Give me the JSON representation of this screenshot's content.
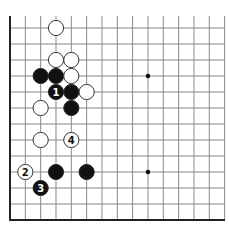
{
  "diagram": {
    "type": "go-board",
    "grid": {
      "cols": 15,
      "rows": 13,
      "x0": 10,
      "y0": 28,
      "dx": 15.33,
      "dy": 16,
      "top_cut": 16,
      "right_end": 225
    },
    "colors": {
      "line": "#888888",
      "edge": "#222222",
      "black": "#111111",
      "white": "#ffffff",
      "star": "#111111"
    },
    "star_points": [
      {
        "col": 9,
        "row": 3
      },
      {
        "col": 9,
        "row": 9
      }
    ],
    "stones": [
      {
        "color": "white",
        "col": 3,
        "row": 0,
        "label": ""
      },
      {
        "color": "white",
        "col": 3,
        "row": 2,
        "label": ""
      },
      {
        "color": "white",
        "col": 4,
        "row": 2,
        "label": ""
      },
      {
        "color": "black",
        "col": 2,
        "row": 3,
        "label": ""
      },
      {
        "color": "black",
        "col": 3,
        "row": 3,
        "label": ""
      },
      {
        "color": "white",
        "col": 4,
        "row": 3,
        "label": ""
      },
      {
        "color": "black",
        "col": 3,
        "row": 4,
        "label": "1"
      },
      {
        "color": "black",
        "col": 4,
        "row": 4,
        "label": ""
      },
      {
        "color": "white",
        "col": 5,
        "row": 4,
        "label": ""
      },
      {
        "color": "white",
        "col": 2,
        "row": 5,
        "label": ""
      },
      {
        "color": "black",
        "col": 4,
        "row": 5,
        "label": ""
      },
      {
        "color": "white",
        "col": 2,
        "row": 7,
        "label": ""
      },
      {
        "color": "white",
        "col": 4,
        "row": 7,
        "label": "4"
      },
      {
        "color": "white",
        "col": 1,
        "row": 9,
        "label": "2"
      },
      {
        "color": "black",
        "col": 3,
        "row": 9,
        "label": ""
      },
      {
        "color": "black",
        "col": 5,
        "row": 9,
        "label": ""
      },
      {
        "color": "black",
        "col": 2,
        "row": 10,
        "label": "3"
      }
    ]
  }
}
